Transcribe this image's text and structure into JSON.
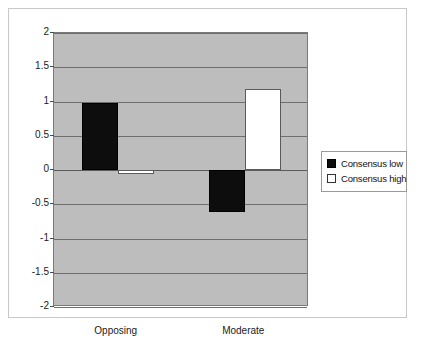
{
  "chart_data": {
    "type": "bar",
    "title": "",
    "xlabel": "",
    "ylabel": "",
    "categories": [
      "Opposing",
      "Moderate"
    ],
    "series": [
      {
        "name": "Consensus low",
        "values": [
          0.98,
          -0.62
        ],
        "color": "#0d0d0d"
      },
      {
        "name": "Consensus high",
        "values": [
          -0.05,
          1.18
        ],
        "color": "#ffffff"
      }
    ],
    "ylim": [
      -2,
      2
    ],
    "yticks": [
      "2",
      "1.5",
      "1",
      "0.5",
      "0",
      "-0.5",
      "-1",
      "-1.5",
      "-2"
    ],
    "ytick_values": [
      2,
      1.5,
      1,
      0.5,
      0,
      -0.5,
      -1,
      -1.5,
      -2
    ],
    "grid": true,
    "legend_position": "right",
    "plot_background": "#bdbdbd",
    "figure_background": "#ffffff"
  },
  "legend": {
    "items": [
      {
        "label": "Consensus low"
      },
      {
        "label": "Consensus high"
      }
    ]
  },
  "axis": {
    "yticks": [
      "2",
      "1.5",
      "1",
      "0.5",
      "0",
      "-0.5",
      "-1",
      "-1.5",
      "-2"
    ]
  },
  "categories": [
    {
      "label": "Opposing"
    },
    {
      "label": "Moderate"
    }
  ]
}
